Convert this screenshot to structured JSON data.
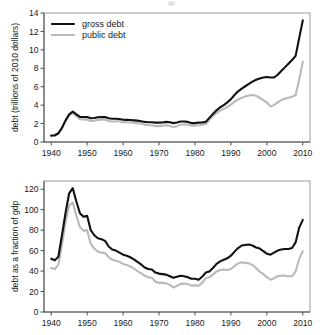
{
  "figure": {
    "name": "us-debt-two-panel-figure",
    "background": "#ffffff",
    "colors": {
      "gross_debt": "#111111",
      "public_debt": "#b9b9b9",
      "axis": "#4d4d4d",
      "frame": "#9a9a9a"
    }
  },
  "chart_data": [
    {
      "id": "top",
      "type": "line",
      "title": "",
      "xlabel": "",
      "ylabel": "debt (trillions of 2010 dollars)",
      "xlim": [
        1938,
        2012
      ],
      "ylim": [
        0,
        14
      ],
      "xticks": [
        1940,
        1950,
        1960,
        1970,
        1980,
        1990,
        2000,
        2010
      ],
      "yticks": [
        0,
        2,
        4,
        6,
        8,
        10,
        12,
        14
      ],
      "xticklabels": [
        "1940",
        "1950",
        "1960",
        "1970",
        "1980",
        "1990",
        "2000",
        "2010"
      ],
      "yticklabels": [
        "0",
        "2",
        "4",
        "6",
        "8",
        "10",
        "12",
        "14"
      ],
      "grid": false,
      "legend": {
        "position": "upper-left",
        "entries": [
          {
            "label": "gross debt",
            "color": "#111111"
          },
          {
            "label": "public debt",
            "color": "#b9b9b9"
          }
        ]
      },
      "x": [
        1940,
        1941,
        1942,
        1943,
        1944,
        1945,
        1946,
        1947,
        1948,
        1949,
        1950,
        1951,
        1952,
        1953,
        1954,
        1955,
        1956,
        1957,
        1958,
        1959,
        1960,
        1961,
        1962,
        1963,
        1964,
        1965,
        1966,
        1967,
        1968,
        1969,
        1970,
        1971,
        1972,
        1973,
        1974,
        1975,
        1976,
        1977,
        1978,
        1979,
        1980,
        1981,
        1982,
        1983,
        1984,
        1985,
        1986,
        1987,
        1988,
        1989,
        1990,
        1991,
        1992,
        1993,
        1994,
        1995,
        1996,
        1997,
        1998,
        1999,
        2000,
        2001,
        2002,
        2003,
        2004,
        2005,
        2006,
        2007,
        2008,
        2009,
        2010
      ],
      "series": [
        {
          "name": "gross debt",
          "color": "#111111",
          "values": [
            0.7,
            0.73,
            0.95,
            1.55,
            2.35,
            3.0,
            3.3,
            3.0,
            2.72,
            2.72,
            2.7,
            2.58,
            2.6,
            2.68,
            2.72,
            2.7,
            2.58,
            2.52,
            2.52,
            2.5,
            2.42,
            2.4,
            2.38,
            2.35,
            2.32,
            2.25,
            2.18,
            2.15,
            2.15,
            2.1,
            2.1,
            2.12,
            2.18,
            2.15,
            2.05,
            2.12,
            2.22,
            2.22,
            2.18,
            2.05,
            2.05,
            2.1,
            2.12,
            2.18,
            2.62,
            3.05,
            3.45,
            3.75,
            4.0,
            4.3,
            4.65,
            5.1,
            5.5,
            5.8,
            6.05,
            6.3,
            6.55,
            6.75,
            6.9,
            7.0,
            7.05,
            7.0,
            7.0,
            7.3,
            7.7,
            8.1,
            8.5,
            8.9,
            9.35,
            11.3,
            13.2
          ]
        },
        {
          "name": "public debt",
          "color": "#b9b9b9",
          "values": [
            0.62,
            0.66,
            0.88,
            1.48,
            2.25,
            2.9,
            3.15,
            2.8,
            2.48,
            2.45,
            2.42,
            2.28,
            2.3,
            2.38,
            2.42,
            2.42,
            2.28,
            2.22,
            2.25,
            2.25,
            2.15,
            2.15,
            2.12,
            2.08,
            2.05,
            1.98,
            1.88,
            1.82,
            1.82,
            1.72,
            1.72,
            1.78,
            1.82,
            1.75,
            1.62,
            1.72,
            1.88,
            1.92,
            1.88,
            1.78,
            1.78,
            1.82,
            1.88,
            1.95,
            2.4,
            2.8,
            3.15,
            3.4,
            3.6,
            3.82,
            4.05,
            4.35,
            4.62,
            4.8,
            4.95,
            5.05,
            5.1,
            5.02,
            4.8,
            4.55,
            4.3,
            3.85,
            4.0,
            4.3,
            4.55,
            4.7,
            4.8,
            4.9,
            5.1,
            6.8,
            8.7
          ]
        }
      ]
    },
    {
      "id": "bottom",
      "type": "line",
      "title": "",
      "xlabel": "",
      "ylabel": "debt as a fraction of gdp",
      "xlim": [
        1938,
        2012
      ],
      "ylim": [
        0,
        128
      ],
      "xticks": [
        1940,
        1950,
        1960,
        1970,
        1980,
        1990,
        2000,
        2010
      ],
      "yticks": [
        0,
        20,
        40,
        60,
        80,
        100,
        120
      ],
      "xticklabels": [
        "1940",
        "1950",
        "1960",
        "1970",
        "1980",
        "1990",
        "2000",
        "2010"
      ],
      "yticklabels": [
        "0",
        "20",
        "40",
        "60",
        "80",
        "100",
        "120"
      ],
      "grid": false,
      "legend": {
        "position": "none",
        "entries": []
      },
      "x": [
        1940,
        1941,
        1942,
        1943,
        1944,
        1945,
        1946,
        1947,
        1948,
        1949,
        1950,
        1951,
        1952,
        1953,
        1954,
        1955,
        1956,
        1957,
        1958,
        1959,
        1960,
        1961,
        1962,
        1963,
        1964,
        1965,
        1966,
        1967,
        1968,
        1969,
        1970,
        1971,
        1972,
        1973,
        1974,
        1975,
        1976,
        1977,
        1978,
        1979,
        1980,
        1981,
        1982,
        1983,
        1984,
        1985,
        1986,
        1987,
        1988,
        1989,
        1990,
        1991,
        1992,
        1993,
        1994,
        1995,
        1996,
        1997,
        1998,
        1999,
        2000,
        2001,
        2002,
        2003,
        2004,
        2005,
        2006,
        2007,
        2008,
        2009,
        2010
      ],
      "series": [
        {
          "name": "gross debt",
          "color": "#111111",
          "values": [
            52.0,
            50.5,
            54.0,
            75.0,
            97.0,
            116.0,
            121.0,
            108.0,
            96.5,
            93.0,
            94.0,
            80.0,
            75.0,
            72.0,
            71.0,
            69.5,
            64.0,
            61.0,
            60.0,
            58.0,
            56.0,
            55.0,
            53.5,
            51.5,
            49.0,
            46.5,
            43.5,
            42.0,
            41.5,
            38.5,
            37.5,
            37.0,
            36.5,
            35.0,
            33.5,
            34.5,
            35.5,
            35.0,
            34.0,
            32.5,
            32.5,
            31.5,
            34.5,
            38.5,
            39.5,
            43.0,
            47.0,
            49.5,
            51.0,
            52.5,
            55.0,
            59.0,
            62.5,
            65.0,
            65.5,
            66.0,
            65.0,
            63.0,
            62.0,
            59.5,
            57.0,
            56.0,
            58.0,
            60.0,
            61.0,
            61.5,
            61.5,
            62.5,
            68.0,
            82.5,
            90.0
          ]
        },
        {
          "name": "public debt",
          "color": "#b9b9b9",
          "values": [
            43.0,
            42.0,
            46.0,
            66.0,
            88.0,
            104.0,
            107.0,
            94.0,
            83.0,
            79.5,
            80.0,
            66.5,
            62.0,
            59.0,
            58.0,
            57.5,
            53.5,
            51.0,
            50.0,
            49.0,
            47.0,
            46.0,
            44.5,
            42.5,
            40.0,
            38.0,
            35.5,
            34.0,
            33.5,
            29.5,
            28.5,
            28.5,
            28.0,
            26.5,
            24.0,
            25.5,
            27.5,
            27.8,
            27.4,
            25.8,
            26.0,
            25.8,
            28.5,
            33.0,
            34.0,
            36.5,
            39.5,
            41.0,
            41.5,
            41.0,
            42.0,
            45.0,
            47.5,
            48.5,
            48.0,
            47.5,
            46.0,
            43.0,
            39.5,
            37.0,
            34.0,
            31.5,
            33.0,
            35.0,
            35.5,
            35.5,
            35.0,
            35.0,
            39.5,
            52.0,
            59.5
          ]
        }
      ]
    }
  ]
}
